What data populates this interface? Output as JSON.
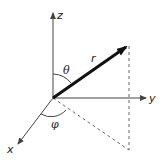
{
  "diagram": {
    "axes": {
      "z": {
        "label": "z"
      },
      "y": {
        "label": "y"
      },
      "x": {
        "label": "x"
      }
    },
    "vector": {
      "label": "r"
    },
    "angles": {
      "polar": {
        "label": "θ"
      },
      "azimuthal": {
        "label": "φ"
      }
    },
    "colors": {
      "axis": "#444444",
      "vector": "#111111",
      "dashed": "#666666",
      "background": "#ffffff"
    }
  }
}
